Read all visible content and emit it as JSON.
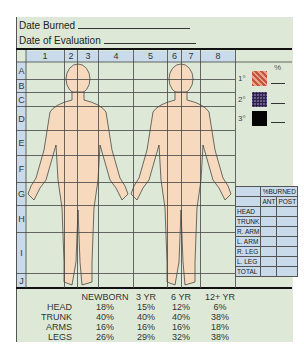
{
  "form": {
    "date_burned_label": "Date Burned",
    "date_evaluation_label": "Date of Evaluation"
  },
  "grid": {
    "columns": [
      "1",
      "2",
      "3",
      "4",
      "5",
      "6",
      "7",
      "8"
    ],
    "rows": [
      "A",
      "B",
      "C",
      "D",
      "E",
      "F",
      "G",
      "H",
      "I",
      "J"
    ]
  },
  "legend": {
    "percent_symbol": "%",
    "items": [
      {
        "label": "1°",
        "color": "#c4553a"
      },
      {
        "label": "2°",
        "color": "#6d5b8f"
      },
      {
        "label": "3°",
        "color": "#050505"
      }
    ]
  },
  "burn_table": {
    "title": "%BURNED",
    "col_ant": "ANT",
    "col_post": "POST",
    "rows": [
      "HEAD",
      "TRUNK",
      "R. ARM",
      "L. ARM",
      "R. LEG",
      "L. LEG",
      "TOTAL"
    ]
  },
  "age_table": {
    "headers": [
      "NEWBORN",
      "3 YR",
      "6 YR",
      "12+ YR"
    ],
    "rows": [
      {
        "label": "HEAD",
        "values": [
          "18%",
          "15%",
          "12%",
          "6%"
        ]
      },
      {
        "label": "TRUNK",
        "values": [
          "40%",
          "40%",
          "40%",
          "38%"
        ]
      },
      {
        "label": "ARMS",
        "values": [
          "16%",
          "16%",
          "16%",
          "18%"
        ]
      },
      {
        "label": "LEGS",
        "values": [
          "26%",
          "29%",
          "32%",
          "38%"
        ]
      }
    ]
  },
  "colors": {
    "background": "#dde9d6",
    "header_blue": "#c9dbeb",
    "skin": "#f7d9bd"
  }
}
